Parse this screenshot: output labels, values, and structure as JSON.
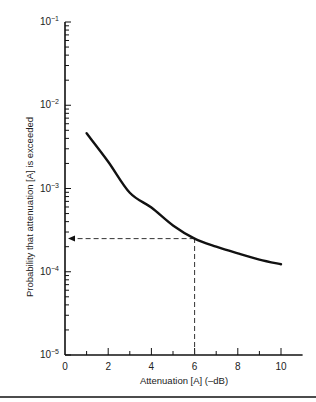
{
  "chart_data": {
    "type": "line",
    "title": "",
    "xlabel": "Attenuation [A] (–dB)",
    "ylabel": "Probability that attenuation [A] is exceeded",
    "x_scale": "linear",
    "y_scale": "log",
    "xlim": [
      0,
      11
    ],
    "ylim": [
      1e-05,
      0.1
    ],
    "x_ticks": [
      0,
      2,
      4,
      6,
      8,
      10
    ],
    "x_tick_labels": [
      "0",
      "2",
      "4",
      "6",
      "8",
      "10"
    ],
    "y_ticks": [
      1e-05,
      0.0001,
      0.001,
      0.01,
      0.1
    ],
    "y_tick_labels": [
      {
        "base": "10",
        "exp": "−5"
      },
      {
        "base": "10",
        "exp": "−4"
      },
      {
        "base": "10",
        "exp": "−3"
      },
      {
        "base": "10",
        "exp": "−2"
      },
      {
        "base": "10",
        "exp": "−1"
      }
    ],
    "grid": false,
    "legend": null,
    "series": [
      {
        "name": "Exceedance probability",
        "x": [
          1,
          2,
          3,
          4,
          5,
          6,
          7,
          8,
          9,
          10
        ],
        "values": [
          0.0046,
          0.0021,
          0.00089,
          0.00059,
          0.00036,
          0.00025,
          0.0002,
          0.000166,
          0.00014,
          0.000123
        ]
      }
    ],
    "annotations": [
      {
        "type": "dashed-guide",
        "description": "Vertical dashed line from x=6 up to curve, then horizontal dashed arrow to y-axis",
        "x": 6,
        "y": 0.00025
      }
    ]
  }
}
